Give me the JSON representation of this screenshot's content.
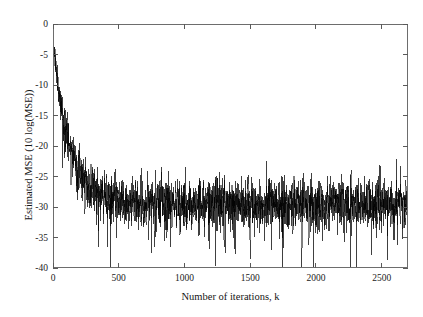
{
  "chart_data": {
    "type": "line",
    "title": "",
    "subtitle": "",
    "xlabel": "Number of iterations, k",
    "ylabel": "Estimated MSE  (10 log(MSE))",
    "xlim": [
      0,
      2700
    ],
    "ylim": [
      -40,
      0
    ],
    "xticks": [
      0,
      500,
      1000,
      1500,
      2000,
      2500
    ],
    "xticklabels": [
      "0",
      "500",
      "1000",
      "1500",
      "2000",
      "2500"
    ],
    "yticks": [
      0,
      -5,
      -10,
      -15,
      -20,
      -25,
      -30,
      -35,
      -40
    ],
    "yticklabels": [
      "0",
      "-5",
      "-10",
      "-15",
      "-20",
      "-25",
      "-30",
      "-35",
      "-40"
    ],
    "grid": false,
    "legend": null,
    "legend_position": "none",
    "annotations": [],
    "line_color": "#000000",
    "line_width": 0.5,
    "series": [
      {
        "name": "Estimated MSE",
        "description": "Noisy adaptive-filter learning curve: fast exponential decay from about -4.5 dB at k=0 to a steady state near -29 dB reached by k~450, then stationary fluctuation for the remainder of the run.",
        "n_points": 2700,
        "initial_value": -4.5,
        "steady_state_value": -29.2,
        "convergence_iteration": 450,
        "decay_time_constant": 130,
        "noise_std_transient": 1.6,
        "noise_std_steady": 2.0,
        "spike_floor": -40,
        "typical_band": [
          -33,
          -25
        ],
        "samples_k": [
          0,
          50,
          100,
          150,
          200,
          250,
          300,
          350,
          400,
          450,
          500,
          700,
          900,
          1100,
          1300,
          1500,
          1700,
          1900,
          2100,
          2300,
          2500,
          2700
        ],
        "samples_value": [
          -4.5,
          -8.5,
          -11.5,
          -14.5,
          -17.5,
          -20.5,
          -23.5,
          -25.5,
          -27.5,
          -28.5,
          -29.0,
          -29.2,
          -29.0,
          -29.2,
          -29.1,
          -29.2,
          -29.0,
          -29.2,
          -29.1,
          -29.2,
          -29.0,
          -29.2
        ]
      }
    ]
  },
  "figure": {
    "background_color": "#ffffff",
    "axis_color": "#6d6d6d",
    "text_color": "#151515"
  }
}
